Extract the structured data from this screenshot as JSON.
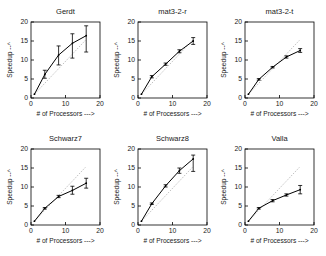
{
  "figure": {
    "width": 326,
    "height": 256,
    "background": "#ffffff",
    "rows": 2,
    "cols": 3,
    "line_color": "#000000",
    "reference_color": "#9a9a9a"
  },
  "axes": {
    "xlabel": "# of Processors --->",
    "ylabel": "Speedup --^",
    "xticks": [
      0,
      10,
      20
    ],
    "yticks": [
      0,
      5,
      10,
      15,
      20
    ],
    "xlim": [
      0,
      20
    ],
    "ylim": [
      0,
      20
    ],
    "xtick_labels": [
      "0",
      "10",
      "20"
    ],
    "ytick_labels": [
      "0",
      "5",
      "10",
      "15",
      "20"
    ]
  },
  "chart_data": [
    {
      "type": "line",
      "title": "Gerdt",
      "xlabel": "# of Processors --->",
      "ylabel": "Speedup --^",
      "xlim": [
        0,
        20
      ],
      "ylim": [
        0,
        20
      ],
      "grid": false,
      "legend": "none",
      "x": [
        1,
        4,
        8,
        12,
        16
      ],
      "values": [
        1.0,
        6.2,
        11.3,
        14.4,
        16.4
      ],
      "yerr_low": [
        0.0,
        1.0,
        2.6,
        3.9,
        4.3
      ],
      "yerr_high": [
        0.0,
        1.1,
        2.4,
        2.5,
        2.6
      ],
      "reference_line": {
        "label": "ideal linear speedup",
        "x": [
          1,
          16
        ],
        "y": [
          1,
          15.4
        ],
        "style": "dotted"
      }
    },
    {
      "type": "line",
      "title": "mat3-2-r",
      "xlabel": "# of Processors --->",
      "ylabel": "Speedup --^",
      "xlim": [
        0,
        20
      ],
      "ylim": [
        0,
        20
      ],
      "grid": false,
      "legend": "none",
      "x": [
        1,
        4,
        8,
        12,
        16
      ],
      "values": [
        1.0,
        5.6,
        8.9,
        12.3,
        15.0
      ],
      "yerr_low": [
        0.0,
        0.3,
        0.3,
        0.4,
        0.9
      ],
      "yerr_high": [
        0.0,
        0.3,
        0.3,
        0.4,
        0.9
      ],
      "reference_line": {
        "label": "ideal linear speedup",
        "x": [
          1,
          16
        ],
        "y": [
          1,
          15.4
        ],
        "style": "dotted"
      }
    },
    {
      "type": "line",
      "title": "mat3-2-t",
      "xlabel": "# of Processors --->",
      "ylabel": "Speedup --^",
      "xlim": [
        0,
        20
      ],
      "ylim": [
        0,
        20
      ],
      "grid": false,
      "legend": "none",
      "x": [
        1,
        4,
        8,
        12,
        16
      ],
      "values": [
        1.0,
        4.9,
        8.1,
        10.8,
        12.5
      ],
      "yerr_low": [
        0.0,
        0.2,
        0.2,
        0.3,
        0.5
      ],
      "yerr_high": [
        0.0,
        0.2,
        0.2,
        0.3,
        0.5
      ],
      "reference_line": {
        "label": "ideal linear speedup",
        "x": [
          1,
          16
        ],
        "y": [
          1,
          15.4
        ],
        "style": "dotted"
      }
    },
    {
      "type": "line",
      "title": "Schwarz7",
      "xlabel": "# of Processors --->",
      "ylabel": "Speedup --^",
      "xlim": [
        0,
        20
      ],
      "ylim": [
        0,
        20
      ],
      "grid": false,
      "legend": "none",
      "x": [
        1,
        4,
        8,
        12,
        16
      ],
      "values": [
        1.0,
        4.4,
        7.5,
        9.1,
        11.0
      ],
      "yerr_low": [
        0.0,
        0.2,
        0.3,
        1.0,
        1.3
      ],
      "yerr_high": [
        0.0,
        0.2,
        0.3,
        1.1,
        1.3
      ],
      "reference_line": {
        "label": "ideal linear speedup",
        "x": [
          1,
          16
        ],
        "y": [
          1,
          15.4
        ],
        "style": "dotted"
      }
    },
    {
      "type": "line",
      "title": "Schwarz8",
      "xlabel": "# of Processors --->",
      "ylabel": "Speedup --^",
      "xlim": [
        0,
        20
      ],
      "ylim": [
        0,
        20
      ],
      "grid": false,
      "legend": "none",
      "x": [
        1,
        4,
        8,
        12,
        16
      ],
      "values": [
        1.0,
        5.6,
        10.3,
        14.3,
        17.4
      ],
      "yerr_low": [
        0.0,
        0.2,
        0.3,
        0.7,
        3.3
      ],
      "yerr_high": [
        0.0,
        0.2,
        0.3,
        0.7,
        1.0
      ],
      "reference_line": {
        "label": "ideal linear speedup",
        "x": [
          1,
          16
        ],
        "y": [
          1,
          15.4
        ],
        "style": "dotted"
      }
    },
    {
      "type": "line",
      "title": "Valla",
      "xlabel": "# of Processors --->",
      "ylabel": "Speedup --^",
      "xlim": [
        0,
        20
      ],
      "ylim": [
        0,
        20
      ],
      "grid": false,
      "legend": "none",
      "x": [
        1,
        4,
        8,
        12,
        16
      ],
      "values": [
        1.0,
        4.4,
        6.4,
        7.9,
        9.3
      ],
      "yerr_low": [
        0.0,
        0.2,
        0.3,
        0.3,
        1.1
      ],
      "yerr_high": [
        0.0,
        0.2,
        0.3,
        0.3,
        1.1
      ],
      "reference_line": {
        "label": "ideal linear speedup",
        "x": [
          1,
          16
        ],
        "y": [
          1,
          15.4
        ],
        "style": "dotted"
      }
    }
  ]
}
